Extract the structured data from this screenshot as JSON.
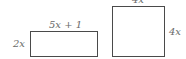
{
  "rectangle": {
    "width_label": "5x + 1",
    "height_label": "2x"
  },
  "square": {
    "top_label": "4x",
    "side_label": "4x"
  },
  "colors": {
    "stroke": "#4a4a4a",
    "text": "#6a6a6a"
  }
}
